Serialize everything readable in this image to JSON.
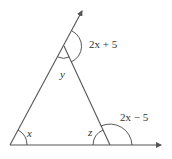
{
  "diagram": {
    "type": "triangle-exterior-angles",
    "colors": {
      "line": "#555555",
      "text": "#333333",
      "background": "#ffffff"
    },
    "vertices": {
      "left": {
        "x": 10,
        "y": 145,
        "angle_label": "x"
      },
      "apex": {
        "x": 64,
        "y": 46,
        "angle_label": "y"
      },
      "right": {
        "x": 110,
        "y": 145,
        "angle_label": "z"
      }
    },
    "rays": [
      {
        "from": "left",
        "through": "apex",
        "end": {
          "x": 82,
          "y": 10
        },
        "arrow": true
      },
      {
        "from": "left",
        "through": "right",
        "end": {
          "x": 162,
          "y": 145
        },
        "arrow": true
      }
    ],
    "labels": {
      "x": "x",
      "y": "y",
      "z": "z",
      "exterior_top": "2x + 5",
      "exterior_right": "2x − 5"
    }
  }
}
